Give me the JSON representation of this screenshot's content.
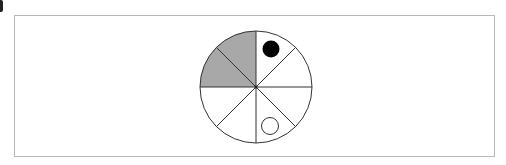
{
  "diagram": {
    "type": "spinner",
    "sectors": 8,
    "shaded_sectors": [
      "upper-left-top",
      "upper-left-bottom"
    ],
    "shade_color": "#a8a8a8",
    "line_color": "#333333",
    "markers": [
      {
        "kind": "filled-circle",
        "sector": "upper-right-top",
        "color": "#000000"
      },
      {
        "kind": "open-circle",
        "sector": "lower-right-bottom",
        "color": "#333333"
      }
    ]
  }
}
